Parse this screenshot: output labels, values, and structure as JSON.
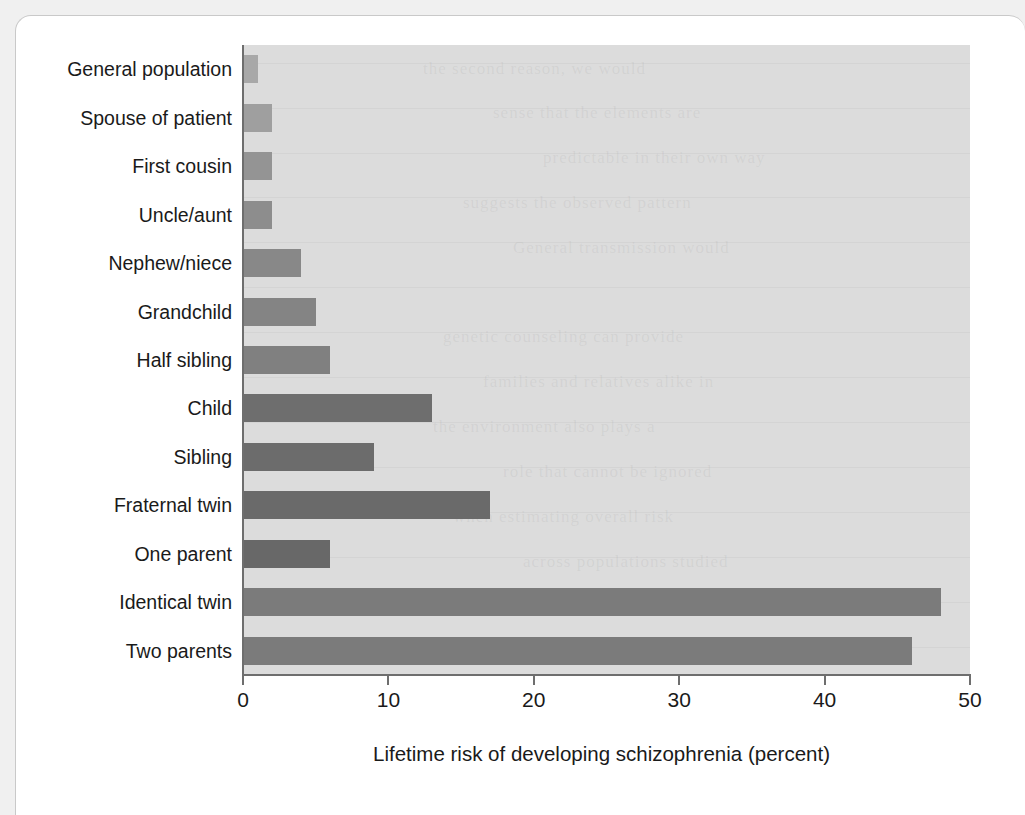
{
  "figure": {
    "card_background": "#ffffff",
    "page_background": "#f0f0f0",
    "plot_background": "#dcdcdc",
    "axis_color": "#6e6e6e"
  },
  "chart_data": {
    "type": "bar",
    "orientation": "horizontal",
    "title": "",
    "xlabel": "Lifetime risk of developing schizophrenia (percent)",
    "ylabel": "",
    "xlim": [
      0,
      50
    ],
    "xticks": [
      "0",
      "10",
      "20",
      "30",
      "40",
      "50"
    ],
    "grid": false,
    "legend": "none",
    "categories": [
      "General population",
      "Spouse of patient",
      "First cousin",
      "Uncle/aunt",
      "Nephew/niece",
      "Grandchild",
      "Half sibling",
      "Child",
      "Sibling",
      "Fraternal twin",
      "One parent",
      "Identical twin",
      "Two parents"
    ],
    "values": [
      1,
      2,
      2,
      2,
      4,
      5,
      6,
      13,
      9,
      17,
      6,
      48,
      46
    ],
    "bar_colors": [
      "#a8a8a8",
      "#9f9f9f",
      "#949494",
      "#8d8d8d",
      "#888888",
      "#848484",
      "#808080",
      "#6e6e6e",
      "#6c6c6c",
      "#6a6a6a",
      "#686868",
      "#7b7b7b",
      "#7b7b7b"
    ]
  }
}
